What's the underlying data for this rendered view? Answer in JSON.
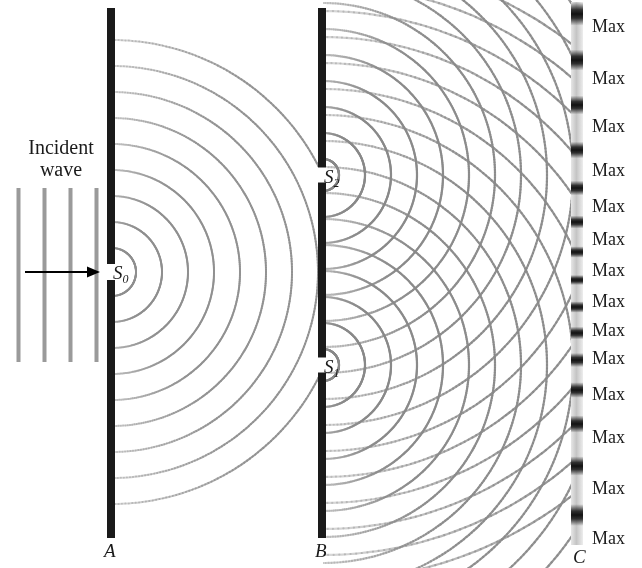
{
  "figure": {
    "background_color": "#ffffff",
    "width": 642,
    "height": 568
  },
  "incident": {
    "label_line1": "Incident",
    "label_line2": "wave",
    "wavefront_color": "#9a9a9a",
    "wavefront_x": [
      18,
      44,
      70,
      96
    ],
    "wavefront_y_top": 188,
    "wavefront_y_bottom": 362,
    "arrow_color": "#000000",
    "arrow_y": 272,
    "arrow_x_start": 25,
    "arrow_x_end": 100
  },
  "barriers": [
    {
      "name": "A",
      "label": "A",
      "x": 107,
      "width": 8,
      "y_top": 8,
      "y_bottom": 538,
      "color": "#1a1a1a",
      "label_x": 104,
      "label_y": 540,
      "slits": [
        {
          "label": "S",
          "subscript": "0",
          "y": 272,
          "gap": 16,
          "label_x": 113,
          "label_y": 262
        }
      ]
    },
    {
      "name": "B",
      "label": "B",
      "x": 318,
      "width": 8,
      "y_top": 8,
      "y_bottom": 538,
      "color": "#1a1a1a",
      "label_x": 315,
      "label_y": 540,
      "slits": [
        {
          "label": "S",
          "subscript": "2",
          "y": 175,
          "gap": 15,
          "label_x": 324,
          "label_y": 166
        },
        {
          "label": "S",
          "subscript": "1",
          "y": 365,
          "gap": 15,
          "label_x": 324,
          "label_y": 356
        }
      ]
    }
  ],
  "screen": {
    "name": "C",
    "label": "C",
    "x": 571,
    "width": 12,
    "y_top": 2,
    "y_bottom": 545,
    "base_color": "#cfcfcf",
    "fringe_color": "#141414",
    "label_x": 573,
    "label_y": 546,
    "fringe_centers": [
      14,
      60,
      105,
      150,
      188,
      222,
      252,
      280,
      307,
      333,
      360,
      390,
      424,
      466,
      515
    ],
    "max_labels": [
      {
        "text": "Max",
        "y": 16
      },
      {
        "text": "Max",
        "y": 68
      },
      {
        "text": "Max",
        "y": 116
      },
      {
        "text": "Max",
        "y": 160
      },
      {
        "text": "Max",
        "y": 196
      },
      {
        "text": "Max",
        "y": 229
      },
      {
        "text": "Max",
        "y": 260
      },
      {
        "text": "Max",
        "y": 291
      },
      {
        "text": "Max",
        "y": 320
      },
      {
        "text": "Max",
        "y": 348
      },
      {
        "text": "Max",
        "y": 384
      },
      {
        "text": "Max",
        "y": 427
      },
      {
        "text": "Max",
        "y": 478
      },
      {
        "text": "Max",
        "y": 528
      }
    ]
  },
  "wave_field": {
    "single_slit": {
      "source_x": 112,
      "source_y": 272,
      "color": "#8f8f8f",
      "line_width": 2,
      "wavelength": 26,
      "num_arcs": 9,
      "first_radius": 24,
      "x_limit": 318
    },
    "double_slit": {
      "color": "#8a8a8a",
      "line_width": 2.2,
      "wavelength": 26,
      "num_arcs": 16,
      "first_radius": 16,
      "x_limit": 573,
      "sources": [
        {
          "x": 323,
          "y": 175
        },
        {
          "x": 323,
          "y": 365
        }
      ]
    }
  }
}
